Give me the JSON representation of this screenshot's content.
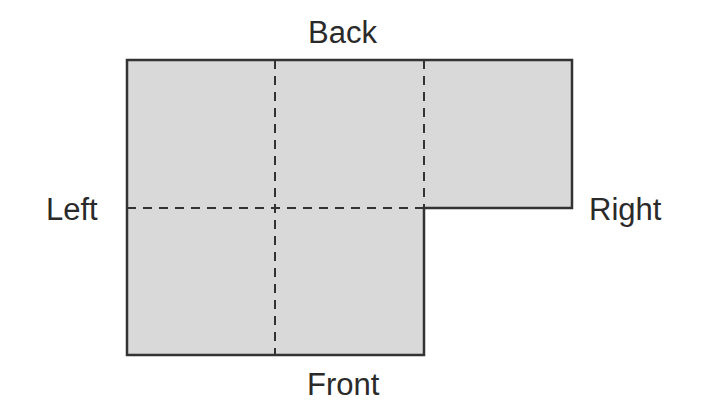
{
  "diagram": {
    "type": "floor-plan-grid",
    "labels": {
      "top": "Back",
      "bottom": "Front",
      "left": "Left",
      "right": "Right"
    },
    "fill_color": "#d9d9d9",
    "stroke_color": "#333333",
    "grid": {
      "rows": 2,
      "cols": 3,
      "filled_cells": [
        [
          0,
          0
        ],
        [
          0,
          1
        ],
        [
          0,
          2
        ],
        [
          1,
          0
        ],
        [
          1,
          1
        ]
      ]
    }
  }
}
